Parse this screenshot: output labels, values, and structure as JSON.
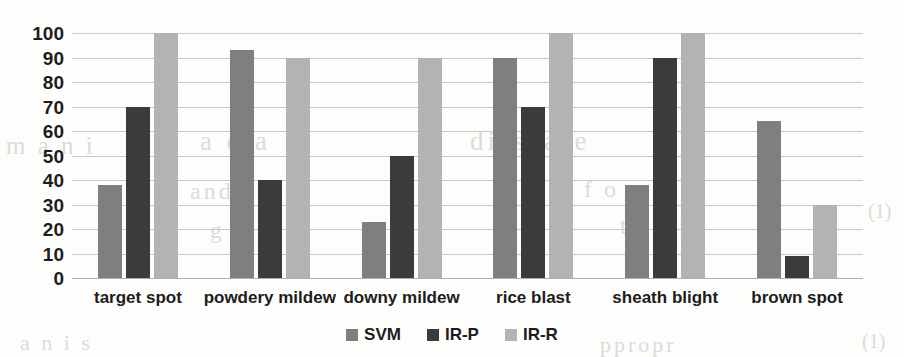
{
  "chart_data": {
    "type": "bar",
    "title": "",
    "xlabel": "",
    "ylabel": "",
    "ylim": [
      0,
      100
    ],
    "ytick_labels": [
      "100",
      "90",
      "80",
      "70",
      "60",
      "50",
      "40",
      "30",
      "20",
      "10",
      "0"
    ],
    "ytick_values": [
      100,
      90,
      80,
      70,
      60,
      50,
      40,
      30,
      20,
      10,
      0
    ],
    "grid": true,
    "legend_position": "bottom-center",
    "categories": [
      "target spot",
      "powdery mildew",
      "downy mildew",
      "rice blast",
      "sheath blight",
      "brown spot"
    ],
    "series": [
      {
        "name": "SVM",
        "color": "#7f7f7f",
        "values": [
          38,
          93,
          23,
          90,
          38,
          64
        ]
      },
      {
        "name": "IR-P",
        "color": "#3b3b3b",
        "values": [
          70,
          40,
          50,
          70,
          90,
          9
        ]
      },
      {
        "name": "IR-R",
        "color": "#b3b3b3",
        "values": [
          100,
          90,
          90,
          100,
          100,
          30
        ]
      }
    ]
  },
  "background_texture": {
    "lines": [
      "m  a   n   i",
      "a d a",
      "dissease",
      "and  t h e",
      "n  f  o  r",
      "g u i",
      "t i o n",
      "a  n  i   s",
      "ppropr",
      "(1)",
      "(1)"
    ]
  }
}
